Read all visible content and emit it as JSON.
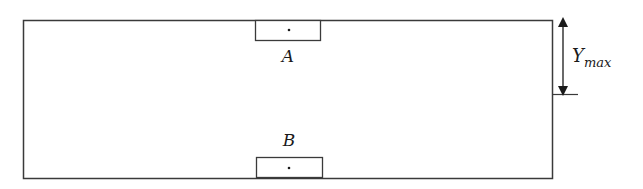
{
  "diagram": {
    "labels": {
      "top_element": "A",
      "bottom_element": "B",
      "dimension_main": "Y",
      "dimension_sub": "max"
    },
    "colors": {
      "stroke": "#3a3a3a",
      "text": "#1a1a1a",
      "background": "#ffffff"
    }
  }
}
